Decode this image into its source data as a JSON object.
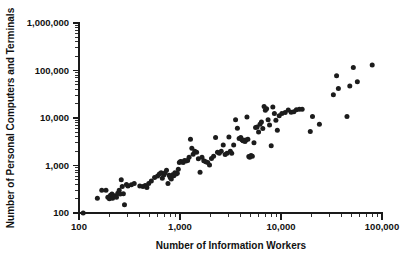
{
  "chart_data": {
    "type": "scatter",
    "title": "",
    "xlabel": "Number of Information Workers",
    "ylabel": "Number of Personal Computers and Terminals",
    "xscale": "log",
    "yscale": "log",
    "xlim": [
      100,
      100000
    ],
    "ylim": [
      100,
      1000000
    ],
    "grid": false,
    "legend": null,
    "xticks": [
      100,
      1000,
      10000,
      100000
    ],
    "xticklabels": [
      "100",
      "1,000",
      "10,000",
      "100,000"
    ],
    "yticks": [
      100,
      1000,
      10000,
      100000,
      1000000
    ],
    "yticklabels": [
      "100",
      "1,000",
      "10,000",
      "100,000",
      "1,000,000"
    ],
    "minor_ticks": true,
    "marker": "filled-circle",
    "marker_color": "#1c1c1c",
    "marker_size_px": 5,
    "n_points": 115,
    "points": [
      [
        110,
        100
      ],
      [
        152,
        205
      ],
      [
        168,
        300
      ],
      [
        185,
        300
      ],
      [
        193,
        215
      ],
      [
        200,
        200
      ],
      [
        205,
        235
      ],
      [
        212,
        250
      ],
      [
        215,
        205
      ],
      [
        222,
        230
      ],
      [
        228,
        225
      ],
      [
        235,
        215
      ],
      [
        242,
        260
      ],
      [
        250,
        300
      ],
      [
        256,
        250
      ],
      [
        262,
        500
      ],
      [
        268,
        360
      ],
      [
        275,
        255
      ],
      [
        282,
        150
      ],
      [
        295,
        400
      ],
      [
        305,
        370
      ],
      [
        330,
        395
      ],
      [
        352,
        420
      ],
      [
        400,
        370
      ],
      [
        430,
        360
      ],
      [
        452,
        380
      ],
      [
        470,
        345
      ],
      [
        490,
        420
      ],
      [
        520,
        470
      ],
      [
        560,
        560
      ],
      [
        600,
        600
      ],
      [
        625,
        660
      ],
      [
        650,
        700
      ],
      [
        668,
        540
      ],
      [
        690,
        630
      ],
      [
        712,
        700
      ],
      [
        735,
        790
      ],
      [
        760,
        420
      ],
      [
        780,
        625
      ],
      [
        800,
        560
      ],
      [
        820,
        520
      ],
      [
        845,
        640
      ],
      [
        868,
        610
      ],
      [
        890,
        700
      ],
      [
        915,
        660
      ],
      [
        940,
        690
      ],
      [
        962,
        830
      ],
      [
        985,
        1150
      ],
      [
        1010,
        1220
      ],
      [
        1040,
        1200
      ],
      [
        1075,
        1160
      ],
      [
        1110,
        1280
      ],
      [
        1150,
        1250
      ],
      [
        1190,
        1270
      ],
      [
        1230,
        1500
      ],
      [
        1270,
        3550
      ],
      [
        1310,
        2300
      ],
      [
        1350,
        1720
      ],
      [
        1400,
        2000
      ],
      [
        1460,
        1900
      ],
      [
        1520,
        1380
      ],
      [
        1580,
        720
      ],
      [
        1650,
        1500
      ],
      [
        1720,
        1260
      ],
      [
        1800,
        1200
      ],
      [
        1880,
        1150
      ],
      [
        1960,
        1030
      ],
      [
        2050,
        1400
      ],
      [
        2150,
        1560
      ],
      [
        2250,
        3900
      ],
      [
        2350,
        1900
      ],
      [
        2450,
        1820
      ],
      [
        2560,
        2000
      ],
      [
        2680,
        2700
      ],
      [
        2800,
        1700
      ],
      [
        2920,
        1800
      ],
      [
        3050,
        4000
      ],
      [
        3150,
        2000
      ],
      [
        3250,
        1820
      ],
      [
        3400,
        2700
      ],
      [
        3550,
        9200
      ],
      [
        3700,
        6100
      ],
      [
        3850,
        3700
      ],
      [
        4000,
        3900
      ],
      [
        4100,
        3500
      ],
      [
        4200,
        3300
      ],
      [
        4300,
        3400
      ],
      [
        4400,
        3200
      ],
      [
        4500,
        3450
      ],
      [
        4600,
        10500
      ],
      [
        4700,
        3550
      ],
      [
        4800,
        1550
      ],
      [
        4900,
        1500
      ],
      [
        5050,
        1620
      ],
      [
        5200,
        1560
      ],
      [
        5400,
        3000
      ],
      [
        5600,
        6300
      ],
      [
        5800,
        6500
      ],
      [
        6000,
        5100
      ],
      [
        6200,
        7400
      ],
      [
        6400,
        8200
      ],
      [
        6600,
        6000
      ],
      [
        6800,
        17500
      ],
      [
        7000,
        14500
      ],
      [
        7200,
        15600
      ],
      [
        7450,
        9200
      ],
      [
        7700,
        7100
      ],
      [
        8000,
        2600
      ],
      [
        8300,
        17000
      ],
      [
        8600,
        12500
      ],
      [
        8900,
        9000
      ],
      [
        9200,
        5500
      ],
      [
        9600,
        11200
      ],
      [
        10200,
        12500
      ],
      [
        11000,
        13000
      ],
      [
        11800,
        14800
      ],
      [
        12600,
        13200
      ],
      [
        13400,
        13500
      ],
      [
        14200,
        15000
      ],
      [
        15200,
        15300
      ],
      [
        16200,
        15200
      ],
      [
        19500,
        5200
      ],
      [
        20500,
        10800
      ],
      [
        24000,
        7400
      ],
      [
        33000,
        31000
      ],
      [
        35500,
        78000
      ],
      [
        37000,
        42000
      ],
      [
        45000,
        10700
      ],
      [
        48000,
        47000
      ],
      [
        52000,
        115000
      ],
      [
        57000,
        58000
      ],
      [
        80000,
        130000
      ]
    ]
  }
}
